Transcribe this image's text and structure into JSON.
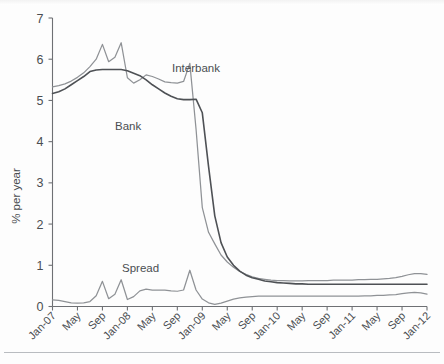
{
  "chart_data": {
    "type": "line",
    "title": "",
    "subtitle": "",
    "xlabel": "",
    "ylabel": "% per year",
    "ylim": [
      0,
      7
    ],
    "yticks": [
      0,
      1,
      2,
      3,
      4,
      5,
      6,
      7
    ],
    "ytick_labels": [
      "0",
      "1",
      "2",
      "3",
      "4",
      "5",
      "6",
      "7"
    ],
    "grid": false,
    "legend_position": "inline-annotations",
    "xtick_labels": [
      "Jan-07",
      "May",
      "Sep",
      "Jan-08",
      "May",
      "Sep",
      "Jan-09",
      "May",
      "Sep",
      "Jan-10",
      "May",
      "Sep",
      "Jan-11",
      "May",
      "Sep",
      "Jan-12"
    ],
    "xtick_indices": [
      0,
      4,
      8,
      12,
      16,
      20,
      24,
      28,
      32,
      36,
      40,
      44,
      48,
      52,
      56,
      60
    ],
    "x": [
      "Jan-07",
      "Feb-07",
      "Mar-07",
      "Apr-07",
      "May-07",
      "Jun-07",
      "Jul-07",
      "Aug-07",
      "Sep-07",
      "Oct-07",
      "Nov-07",
      "Dec-07",
      "Jan-08",
      "Feb-08",
      "Mar-08",
      "Apr-08",
      "May-08",
      "Jun-08",
      "Jul-08",
      "Aug-08",
      "Sep-08",
      "Oct-08",
      "Nov-08",
      "Dec-08",
      "Jan-09",
      "Feb-09",
      "Mar-09",
      "Apr-09",
      "May-09",
      "Jun-09",
      "Jul-09",
      "Aug-09",
      "Sep-09",
      "Oct-09",
      "Nov-09",
      "Dec-09",
      "Jan-10",
      "Feb-10",
      "Mar-10",
      "Apr-10",
      "May-10",
      "Jun-10",
      "Jul-10",
      "Aug-10",
      "Sep-10",
      "Oct-10",
      "Nov-10",
      "Dec-10",
      "Jan-11",
      "Feb-11",
      "Mar-11",
      "Apr-11",
      "May-11",
      "Jun-11",
      "Jul-11",
      "Aug-11",
      "Sep-11",
      "Oct-11",
      "Nov-11",
      "Dec-11",
      "Jan-12"
    ],
    "series": [
      {
        "name": "Interbank",
        "color": "#8f9296",
        "label_x_index": 25,
        "values": [
          5.33,
          5.36,
          5.4,
          5.47,
          5.56,
          5.67,
          5.82,
          6.0,
          6.36,
          5.94,
          6.05,
          6.4,
          5.55,
          5.42,
          5.5,
          5.62,
          5.58,
          5.52,
          5.45,
          5.43,
          5.42,
          5.46,
          5.9,
          4.3,
          2.4,
          1.8,
          1.52,
          1.25,
          1.08,
          0.95,
          0.85,
          0.78,
          0.72,
          0.68,
          0.66,
          0.64,
          0.63,
          0.63,
          0.62,
          0.62,
          0.62,
          0.63,
          0.63,
          0.63,
          0.63,
          0.64,
          0.64,
          0.64,
          0.64,
          0.65,
          0.65,
          0.66,
          0.66,
          0.67,
          0.68,
          0.7,
          0.73,
          0.77,
          0.8,
          0.8,
          0.78
        ]
      },
      {
        "name": "Bank",
        "color": "#4e5155",
        "label_x_index": 15,
        "values": [
          5.17,
          5.21,
          5.28,
          5.38,
          5.48,
          5.58,
          5.7,
          5.74,
          5.75,
          5.75,
          5.75,
          5.75,
          5.72,
          5.66,
          5.6,
          5.5,
          5.38,
          5.28,
          5.18,
          5.1,
          5.04,
          5.02,
          5.02,
          5.03,
          4.7,
          3.4,
          2.2,
          1.55,
          1.2,
          1.0,
          0.86,
          0.76,
          0.7,
          0.66,
          0.62,
          0.6,
          0.58,
          0.57,
          0.56,
          0.55,
          0.55,
          0.54,
          0.54,
          0.54,
          0.54,
          0.54,
          0.54,
          0.54,
          0.54,
          0.54,
          0.54,
          0.54,
          0.54,
          0.54,
          0.54,
          0.54,
          0.54,
          0.54,
          0.54,
          0.54,
          0.54
        ]
      },
      {
        "name": "Spread",
        "color": "#8f9296",
        "label_x_index": 19,
        "values": [
          0.16,
          0.15,
          0.12,
          0.09,
          0.08,
          0.09,
          0.12,
          0.26,
          0.61,
          0.19,
          0.3,
          0.65,
          0.17,
          0.24,
          0.38,
          0.42,
          0.4,
          0.4,
          0.4,
          0.38,
          0.37,
          0.4,
          0.88,
          0.4,
          0.18,
          0.09,
          0.05,
          0.08,
          0.13,
          0.18,
          0.21,
          0.23,
          0.24,
          0.25,
          0.25,
          0.25,
          0.25,
          0.25,
          0.25,
          0.25,
          0.25,
          0.25,
          0.25,
          0.25,
          0.25,
          0.25,
          0.25,
          0.25,
          0.25,
          0.25,
          0.26,
          0.26,
          0.27,
          0.27,
          0.28,
          0.29,
          0.31,
          0.33,
          0.34,
          0.33,
          0.3
        ]
      }
    ]
  },
  "labels": {
    "y_axis_title": "% per year",
    "interbank": "Interbank",
    "bank": "Bank",
    "spread": "Spread"
  },
  "colors": {
    "line_light": "#8f9296",
    "line_dark": "#4e5155",
    "axis": "#6e7074",
    "text": "#4a4d51",
    "background": "#fdfdfd"
  }
}
